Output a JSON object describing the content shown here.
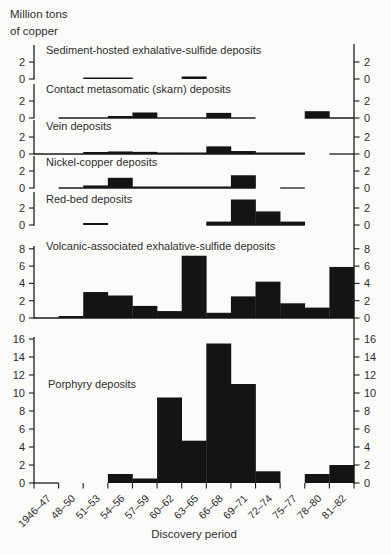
{
  "title": {
    "line1": "Million tons",
    "line2": "of copper"
  },
  "chart_data": {
    "type": "bar",
    "title": "Million tons of copper",
    "xlabel": "Discovery period",
    "ylabel": "Million tons of copper",
    "bar_color": "#141414",
    "axis_color": "#1c1c1c",
    "legend": "none",
    "grid": false,
    "categories": [
      "1946–47",
      "48–50",
      "51–53",
      "54–56",
      "57–59",
      "60–62",
      "63–65",
      "66–68",
      "69–71",
      "72–74",
      "75–77",
      "78–80",
      "81–82"
    ],
    "panels": [
      {
        "title": "Sediment-hosted exhalative-sulfide deposits",
        "ylim": [
          0,
          2
        ],
        "yticks": [
          0,
          2
        ],
        "values": [
          0,
          0,
          0.1,
          0.1,
          0,
          0,
          0.3,
          0,
          0,
          0,
          0,
          0,
          0
        ],
        "baseline_segments": []
      },
      {
        "title": "Contact metasomatic (skarn) deposits",
        "ylim": [
          0,
          2
        ],
        "yticks": [
          0,
          2
        ],
        "values": [
          0,
          0,
          0,
          0.2,
          0.65,
          0,
          0,
          0.6,
          0,
          0,
          0,
          0.8,
          0
        ],
        "baseline_segments": [
          [
            1,
            9
          ],
          [
            11,
            13
          ]
        ]
      },
      {
        "title": "Vein deposits",
        "ylim": [
          0,
          2
        ],
        "yticks": [
          0,
          2
        ],
        "values": [
          0,
          0,
          0.2,
          0.3,
          0.25,
          0.1,
          0.1,
          0.9,
          0.35,
          0.1,
          0.1,
          0,
          0
        ],
        "baseline_segments": [
          [
            0,
            11
          ],
          [
            12,
            13
          ]
        ]
      },
      {
        "title": "Nickel-copper deposits",
        "ylim": [
          0,
          2
        ],
        "yticks": [
          0,
          2
        ],
        "values": [
          0,
          0,
          0.3,
          1.2,
          0.1,
          0.1,
          0.1,
          0.1,
          1.5,
          0,
          0,
          0,
          0
        ],
        "baseline_segments": [
          [
            1,
            9
          ],
          [
            10,
            11
          ]
        ]
      },
      {
        "title": "Red-bed deposits",
        "ylim": [
          0,
          2
        ],
        "yticks": [
          0,
          2
        ],
        "values": [
          0,
          0,
          0.2,
          0,
          0,
          0,
          0,
          0.4,
          3.0,
          1.6,
          0.4,
          0,
          0
        ],
        "baseline_segments": [
          [
            7,
            11
          ]
        ]
      },
      {
        "title": "Volcanic-associated exhalative-sulfide deposits",
        "ylim": [
          0,
          8
        ],
        "yticks": [
          0,
          2,
          4,
          6,
          8
        ],
        "values": [
          0,
          0.2,
          3.0,
          2.6,
          1.4,
          0.8,
          7.2,
          0.6,
          2.5,
          4.2,
          1.7,
          1.2,
          5.9
        ],
        "baseline_segments": [
          [
            0,
            13
          ]
        ]
      },
      {
        "title": "Porphyry deposits",
        "ylim": [
          0,
          16
        ],
        "yticks": [
          0,
          2,
          4,
          6,
          8,
          10,
          12,
          14,
          16
        ],
        "values": [
          0,
          0,
          0,
          1.0,
          0.5,
          9.5,
          4.7,
          15.5,
          11.0,
          1.3,
          0,
          1.0,
          2.0
        ],
        "baseline_segments": [
          [
            0,
            1
          ]
        ]
      }
    ]
  }
}
